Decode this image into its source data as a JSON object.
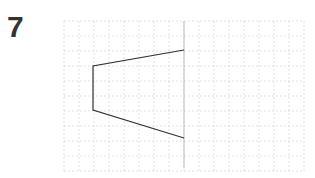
{
  "question": {
    "number": "7"
  },
  "grid": {
    "x0": 64,
    "y0": 21,
    "cell": 15,
    "cols": 16,
    "rows": 10,
    "line_color": "#d9d9d9"
  },
  "mirror_line": {
    "x": 184,
    "y1": 21,
    "y2": 168,
    "color": "#bbbbbb"
  },
  "shape": {
    "type": "trapezoid",
    "color": "#333333",
    "vertices": [
      [
        184,
        50
      ],
      [
        93,
        66
      ],
      [
        93,
        110
      ],
      [
        184,
        138
      ]
    ]
  }
}
